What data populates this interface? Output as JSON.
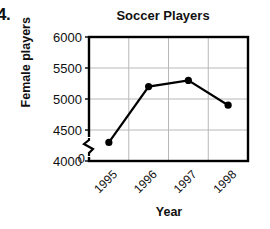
{
  "item_number": "4.",
  "chart_data": {
    "type": "line",
    "title": "Soccer Players",
    "xlabel": "Year",
    "ylabel": "Female players",
    "categories": [
      "1995",
      "1996",
      "1997",
      "1998"
    ],
    "values": [
      4300,
      5200,
      5300,
      4900
    ],
    "series": [
      {
        "name": "Female players",
        "values": [
          4300,
          5200,
          5300,
          4900
        ]
      }
    ],
    "ylim": [
      4000,
      6000
    ],
    "y_ticks": [
      4000,
      4500,
      5000,
      5500,
      6000
    ],
    "y_tick_labels": [
      "4000",
      "4500",
      "5000",
      "5500",
      "6000"
    ],
    "y_origin_label": "0",
    "y_axis_break": true,
    "x_ticks": [
      "1995",
      "1996",
      "1997",
      "1998"
    ],
    "x_tick_rotation": -45,
    "grid": true,
    "grid_color": "#b8b8b8",
    "legend": false,
    "line_color": "#000000",
    "marker": "circle",
    "marker_color": "#000000",
    "frame_color": "#000000",
    "background_color": "#ffffff"
  },
  "icons": {
    "axis_break": "zigzag-break-icon"
  }
}
